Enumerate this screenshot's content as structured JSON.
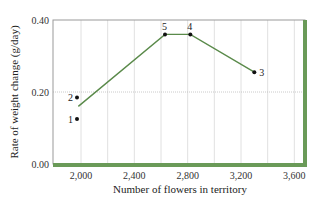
{
  "chart_data": {
    "type": "line",
    "title": "",
    "xlabel": "Number of flowers in territory",
    "ylabel": "Rate of weight change (g/day)",
    "xlim": [
      1790,
      3680
    ],
    "ylim": [
      0.0,
      0.4
    ],
    "x_ticks": [
      2000,
      2400,
      2800,
      3200,
      3600
    ],
    "x_tick_labels": [
      "2,000",
      "2,400",
      "2,800",
      "3,200",
      "3,600"
    ],
    "y_ticks": [
      0.0,
      0.2,
      0.4
    ],
    "y_tick_labels": [
      "0.00",
      "0.20",
      "0.40"
    ],
    "x_gridlines": [
      2000,
      2200,
      2400,
      2600,
      2800,
      3000,
      3200,
      3400,
      3600
    ],
    "y_gridlines": [
      0.2
    ],
    "grid": true,
    "points": [
      {
        "label": "1",
        "x": 1970,
        "y": 0.125
      },
      {
        "label": "2",
        "x": 1970,
        "y": 0.185
      },
      {
        "label": "5",
        "x": 2630,
        "y": 0.36
      },
      {
        "label": "4",
        "x": 2820,
        "y": 0.36
      },
      {
        "label": "3",
        "x": 3300,
        "y": 0.255
      }
    ],
    "series": [
      {
        "name": "trend",
        "x": [
          1980,
          2630,
          2820,
          3300
        ],
        "y": [
          0.16,
          0.36,
          0.36,
          0.255
        ]
      }
    ],
    "colors": {
      "line": "#5a8a4a",
      "frame_accent": "#6a9a58",
      "grid": "#d8d8d8",
      "point": "#111111"
    }
  }
}
